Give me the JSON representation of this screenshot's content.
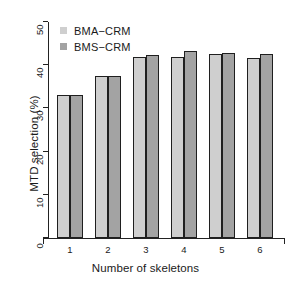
{
  "chart_data": {
    "type": "bar",
    "title": "",
    "xlabel": "Number of skeletons",
    "ylabel": "MTD selection (%)",
    "categories": [
      "1",
      "2",
      "3",
      "4",
      "5",
      "6"
    ],
    "series": [
      {
        "name": "BMA−CRM",
        "color": "#cfcfcf",
        "values": [
          33.0,
          37.5,
          41.8,
          42.0,
          42.6,
          41.6
        ]
      },
      {
        "name": "BMS−CRM",
        "color": "#a3a3a3",
        "values": [
          33.0,
          37.4,
          42.4,
          43.3,
          42.8,
          42.5
        ]
      }
    ],
    "ylim": [
      0,
      50
    ],
    "yticks": [
      0,
      10,
      20,
      30,
      40,
      50
    ],
    "ytick_labels": [
      "0",
      "10",
      "20",
      "30",
      "40",
      "50"
    ],
    "grid": false,
    "legend_position": "top-left"
  },
  "legend": {
    "entries": [
      {
        "label": "BMA−CRM",
        "swatch": "#cfcfcf"
      },
      {
        "label": "BMS−CRM",
        "swatch": "#a3a3a3"
      }
    ]
  },
  "axes": {
    "x_title": "Number of skeletons",
    "y_title": "MTD selection (%)"
  }
}
